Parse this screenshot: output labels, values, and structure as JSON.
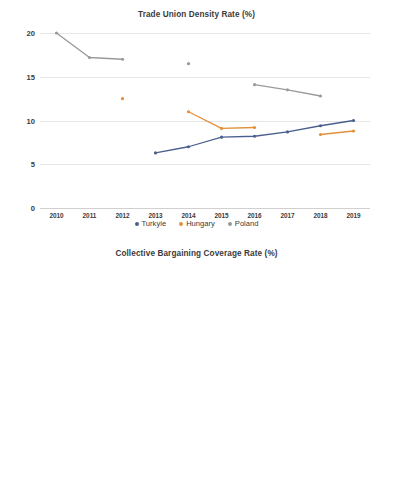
{
  "colors": {
    "turkyie": "#4a5f8e",
    "hungary": "#e2903b",
    "poland": "#9a9a9a",
    "hungary_blue": "#5b8cc0",
    "grid": "#e6e6e6",
    "text": "#3b3b3b"
  },
  "charts": [
    {
      "id": "trade-union-density",
      "title": "Trade Union Density Rate (%)",
      "legend": [
        {
          "label": "Turkyie",
          "color": "#4a5f8e",
          "marker": "diamond-marker"
        },
        {
          "label": "Hungary",
          "color": "#e2903b",
          "marker": "diamond-marker"
        },
        {
          "label": "Poland",
          "color": "#9a9a9a",
          "marker": "diamond-marker"
        }
      ],
      "yticks": [
        "20",
        "15",
        "10",
        "5",
        "0"
      ],
      "xticks": [
        "2010",
        "2011",
        "2012",
        "2013",
        "2014",
        "2015",
        "2016",
        "2017",
        "2018",
        "2019"
      ]
    },
    {
      "id": "collective-bargaining-coverage",
      "title": "Collective Bargaining Coverage Rate (%)",
      "legend": [
        {
          "label": "Hungary",
          "color": "#5b8cc0",
          "marker": "diamond-marker"
        },
        {
          "label": "Poland",
          "color": "#e2903b",
          "marker": "diamond-marker"
        },
        {
          "label": "Turkyie",
          "color": "#9a9a9a",
          "marker": "diamond-marker"
        }
      ],
      "yticks": [
        "28,0",
        "26,0",
        "24,0",
        "22,0",
        "20,0",
        "18,0",
        "16,0",
        "14,0",
        "12,0",
        "10,0",
        "8,0",
        "6,0",
        "4,0"
      ],
      "xticks": [
        "2009",
        "2010",
        "2011",
        "2012",
        "2013",
        "2014",
        "2015",
        "2016",
        "2017",
        "2018",
        "2019"
      ]
    }
  ],
  "chart_data": [
    {
      "type": "line",
      "title": "Trade Union Density Rate (%)",
      "xlabel": "",
      "ylabel": "",
      "x": [
        2010,
        2011,
        2012,
        2013,
        2014,
        2015,
        2016,
        2017,
        2018,
        2019
      ],
      "ylim": [
        0,
        20
      ],
      "yticks": [
        0,
        5,
        10,
        15,
        20
      ],
      "grid": true,
      "legend_position": "bottom",
      "series": [
        {
          "name": "Turkyie",
          "color": "#4a5f8e",
          "x": [
            2013,
            2014,
            2015,
            2016,
            2017,
            2018,
            2019
          ],
          "values": [
            6.3,
            7.0,
            8.1,
            8.2,
            8.7,
            9.4,
            10.0
          ]
        },
        {
          "name": "Hungary",
          "color": "#e2903b",
          "segments": [
            {
              "x": [
                2012
              ],
              "values": [
                12.5
              ]
            },
            {
              "x": [
                2014,
                2015,
                2016
              ],
              "values": [
                11.0,
                9.1,
                9.2
              ]
            },
            {
              "x": [
                2018,
                2019
              ],
              "values": [
                8.4,
                8.8
              ]
            }
          ]
        },
        {
          "name": "Poland",
          "color": "#9a9a9a",
          "segments": [
            {
              "x": [
                2010,
                2011,
                2012
              ],
              "values": [
                20.0,
                17.2,
                17.0
              ]
            },
            {
              "x": [
                2014
              ],
              "values": [
                16.5
              ]
            },
            {
              "x": [
                2016,
                2017,
                2018
              ],
              "values": [
                14.1,
                13.5,
                12.8
              ]
            }
          ]
        }
      ]
    },
    {
      "type": "line",
      "title": "Collective Bargaining Coverage Rate (%)",
      "xlabel": "",
      "ylabel": "",
      "x": [
        2009,
        2010,
        2011,
        2012,
        2013,
        2014,
        2015,
        2016,
        2017,
        2018,
        2019
      ],
      "ylim": [
        4.0,
        28.0
      ],
      "yticks": [
        4.0,
        6.0,
        8.0,
        10.0,
        12.0,
        14.0,
        16.0,
        18.0,
        20.0,
        22.0,
        24.0,
        26.0,
        28.0
      ],
      "grid": true,
      "legend_position": "bottom",
      "series": [
        {
          "name": "Hungary",
          "color": "#5b8cc0",
          "segments": [
            {
              "x": [
                2009,
                2010,
                2011,
                2012,
                2013,
                2014,
                2015
              ],
              "values": [
                26.9,
                27.3,
                26.4,
                26.4,
                25.6,
                22.9,
                20.1
              ]
            },
            {
              "x": [
                2019
              ],
              "values": [
                18.0
              ]
            }
          ]
        },
        {
          "name": "Poland",
          "color": "#e2903b",
          "segments": [
            {
              "x": [
                2010,
                2011,
                2012
              ],
              "values": [
                18.6,
                18.1,
                17.7
              ]
            },
            {
              "x": [
                2015
              ],
              "values": [
                17.3
              ]
            }
          ]
        },
        {
          "name": "Turkyie",
          "color": "#9a9a9a",
          "segments": [
            {
              "x": [
                2012,
                2013,
                2014,
                2015,
                2016,
                2017,
                2018,
                2019
              ],
              "values": [
                4.5,
                5.4,
                5.7,
                5.7,
                6.0,
                7.9,
                6.2,
                7.5
              ]
            }
          ]
        }
      ]
    }
  ]
}
